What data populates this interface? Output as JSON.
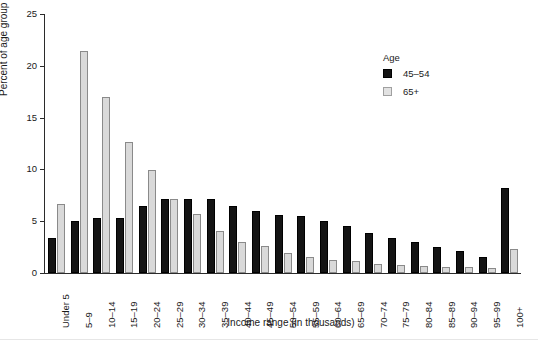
{
  "chart_data": {
    "type": "bar",
    "title": "",
    "subtitle": "",
    "xlabel": "Income range (in thousands)",
    "ylabel": "Percent of age group",
    "categories": [
      "Under 5",
      "5–9",
      "10–14",
      "15–19",
      "20–24",
      "25–29",
      "30–34",
      "35–39",
      "40–44",
      "45–49",
      "50–54",
      "55–59",
      "60–64",
      "65–69",
      "70–74",
      "75–79",
      "80–84",
      "85–89",
      "90–94",
      "95–99",
      "100+"
    ],
    "series": [
      {
        "name": "45–54",
        "color": "#141414",
        "values": [
          3.4,
          5.0,
          5.3,
          5.3,
          6.5,
          7.1,
          7.1,
          7.1,
          6.5,
          6.0,
          5.6,
          5.5,
          5.0,
          4.5,
          3.9,
          3.4,
          3.0,
          2.5,
          2.1,
          1.5,
          8.2
        ]
      },
      {
        "name": "65+",
        "color": "#d9d9d9",
        "values": [
          6.7,
          21.4,
          17.0,
          12.6,
          9.9,
          7.1,
          5.7,
          4.1,
          3.0,
          2.6,
          1.9,
          1.5,
          1.3,
          1.2,
          0.9,
          0.8,
          0.7,
          0.6,
          0.6,
          0.5,
          2.3
        ]
      }
    ],
    "ylim": [
      0,
      25
    ],
    "yticks": [
      0,
      5,
      10,
      15,
      20,
      25
    ],
    "grid": false,
    "legend": {
      "position": "top-right",
      "title": "Age",
      "entries": [
        "45–54",
        "65+"
      ]
    }
  }
}
